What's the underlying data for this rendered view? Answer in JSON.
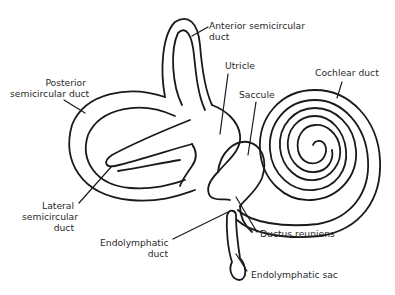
{
  "diagram": {
    "line_color": "#1a1a1a",
    "background": "#ffffff",
    "labels": {
      "anterior_semicircular_duct": {
        "line1": "Anterior semicircular",
        "line2": "duct"
      },
      "posterior_semicircular_duct": {
        "line1": "Posterior",
        "line2": "semicircular duct"
      },
      "utricle": "Utricle",
      "saccule": "Saccule",
      "cochlear_duct": "Cochlear duct",
      "lateral_semicircular_duct": {
        "line1": "Lateral",
        "line2": "semicircular",
        "line3": "duct"
      },
      "endolymphatic_duct": {
        "line1": "Endolymphatic",
        "line2": "duct"
      },
      "ductus_reuniens": "Ductus reuniens",
      "endolymphatic_sac": "Endolymphatic sac"
    }
  }
}
